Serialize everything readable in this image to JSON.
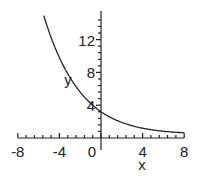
{
  "chart_data": {
    "type": "line",
    "title": "",
    "xlabel": "x",
    "ylabel": "y",
    "xlim": [
      -8,
      8
    ],
    "ylim": [
      0,
      16
    ],
    "x_ticks": [
      "-8",
      "-4",
      "0",
      "4",
      "8"
    ],
    "y_ticks": [
      "4",
      "8",
      "12"
    ],
    "grid": false,
    "series": [
      {
        "name": "y",
        "x": [
          -5.5,
          -4,
          -3,
          -2,
          -1,
          0,
          1,
          2,
          3,
          4,
          5,
          6,
          7,
          8
        ],
        "values": [
          15.0,
          9.8,
          7.4,
          5.6,
          4.3,
          3.3,
          2.5,
          1.9,
          1.5,
          1.2,
          1.0,
          0.9,
          0.8,
          0.7
        ]
      }
    ]
  }
}
